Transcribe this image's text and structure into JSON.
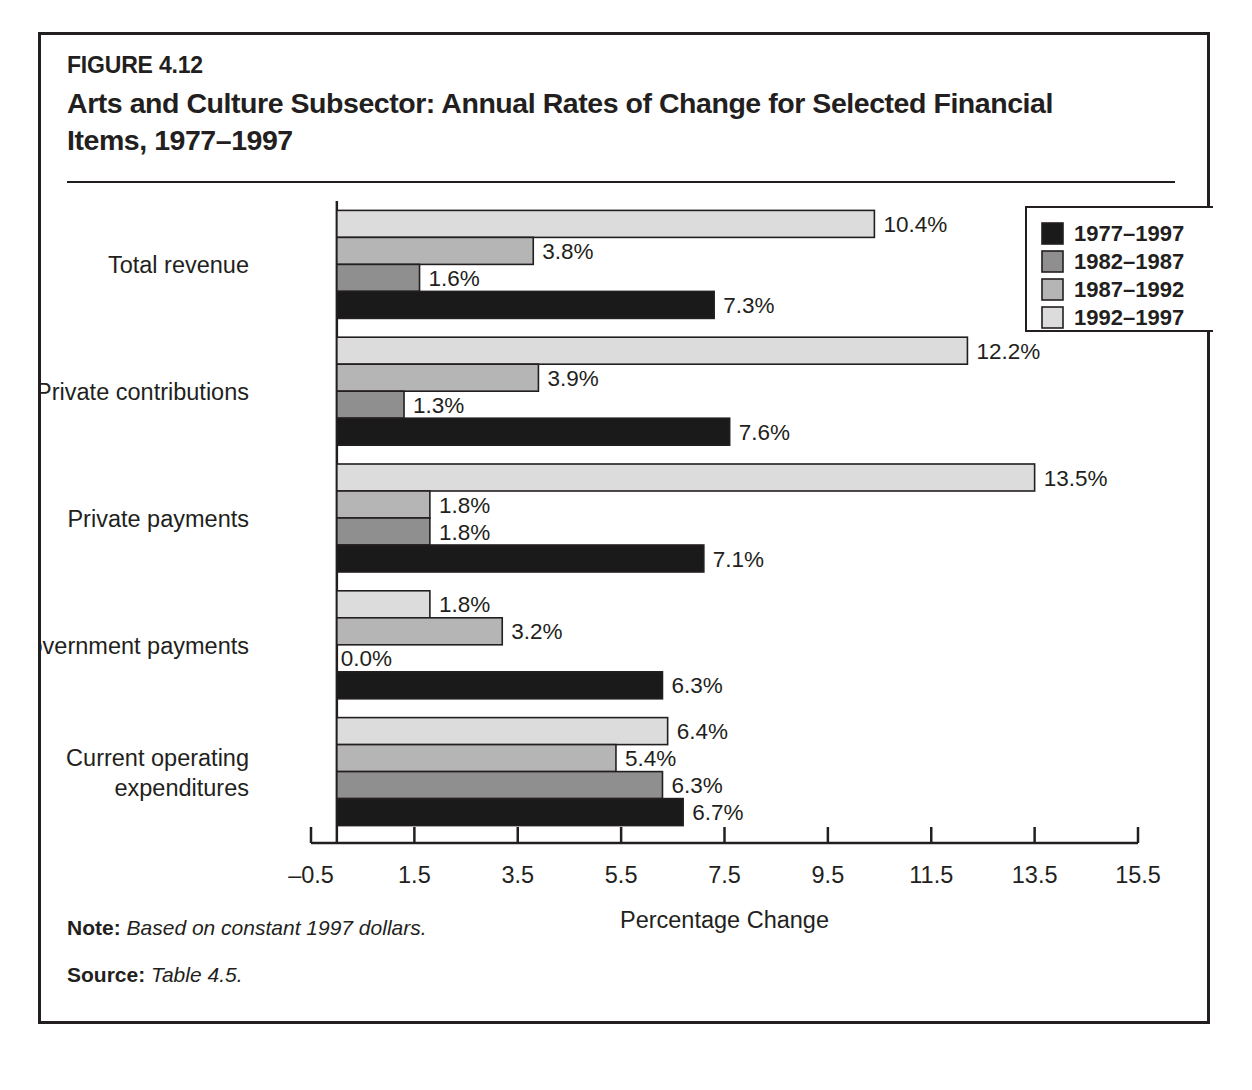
{
  "figure": {
    "number": "FIGURE 4.12",
    "title": "Arts and Culture Subsector: Annual Rates of Change for Selected Financial Items, 1977–1997",
    "note_label": "Note:",
    "note_text": "Based on constant 1997 dollars.",
    "source_label": "Source:",
    "source_text": "Table 4.5."
  },
  "colors": {
    "frame": "#231f20",
    "text": "#231f20",
    "series_1977_1997": "#1a1a1a",
    "series_1982_1987": "#8f8f8f",
    "series_1987_1992": "#b5b5b5",
    "series_1992_1997": "#dcdcdc",
    "bar_outline": "#231f20",
    "axis": "#231f20"
  },
  "chart_data": {
    "type": "bar",
    "orientation": "horizontal",
    "title": "Arts and Culture Subsector: Annual Rates of Change for Selected Financial Items, 1977–1997",
    "xlabel": "Percentage Change",
    "ylabel": "",
    "xlim": [
      -0.5,
      15.5
    ],
    "xticks": [
      -0.5,
      1.5,
      3.5,
      5.5,
      7.5,
      9.5,
      11.5,
      13.5,
      15.5
    ],
    "xtick_labels": [
      "–0.5",
      "1.5",
      "3.5",
      "5.5",
      "7.5",
      "9.5",
      "11.5",
      "13.5",
      "15.5"
    ],
    "grid": false,
    "legend_position": "top-right",
    "categories": [
      "Total revenue",
      "Private contributions",
      "Private payments",
      "Government payments",
      "Current operating\nexpenditures"
    ],
    "category_labels": [
      [
        "Total revenue"
      ],
      [
        "Private contributions"
      ],
      [
        "Private payments"
      ],
      [
        "Government payments"
      ],
      [
        "Current operating",
        "expenditures"
      ]
    ],
    "series": [
      {
        "name": "1977–1997",
        "color": "#1a1a1a",
        "values": [
          7.3,
          7.6,
          7.1,
          6.3,
          6.7
        ],
        "labels": [
          "7.3%",
          "7.6%",
          "7.1%",
          "6.3%",
          "6.7%"
        ]
      },
      {
        "name": "1982–1987",
        "color": "#8f8f8f",
        "values": [
          1.6,
          1.3,
          1.8,
          0.0,
          6.3
        ],
        "labels": [
          "1.6%",
          "1.3%",
          "1.8%",
          "0.0%",
          "6.3%"
        ]
      },
      {
        "name": "1987–1992",
        "color": "#b5b5b5",
        "values": [
          3.8,
          3.9,
          1.8,
          3.2,
          5.4
        ],
        "labels": [
          "3.8%",
          "3.9%",
          "1.8%",
          "3.2%",
          "5.4%"
        ]
      },
      {
        "name": "1992–1997",
        "color": "#dcdcdc",
        "values": [
          10.4,
          12.2,
          13.5,
          1.8,
          6.4
        ],
        "labels": [
          "10.4%",
          "12.2%",
          "13.5%",
          "1.8%",
          "6.4%"
        ]
      }
    ]
  }
}
